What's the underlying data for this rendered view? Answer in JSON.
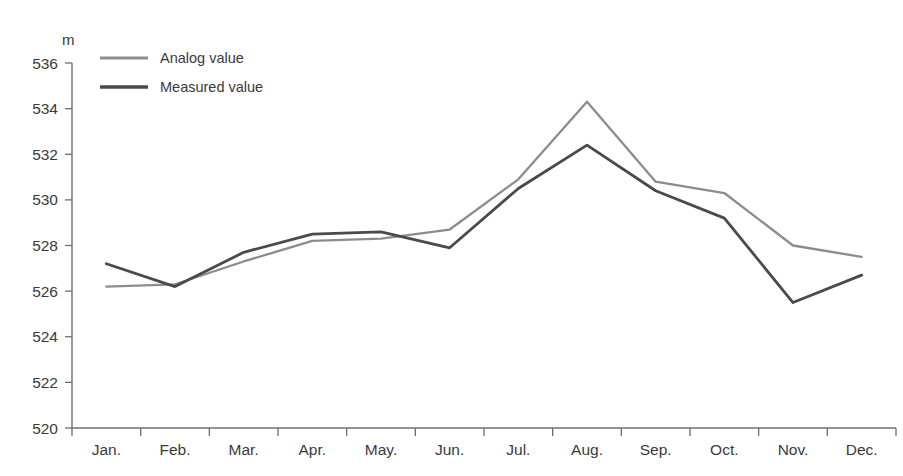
{
  "chart_data": {
    "type": "line",
    "title": "",
    "xlabel": "",
    "ylabel": "m",
    "unit_label": "m",
    "categories": [
      "Jan.",
      "Feb.",
      "Mar.",
      "Apr.",
      "May.",
      "Jun.",
      "Jul.",
      "Aug.",
      "Sep.",
      "Oct.",
      "Nov.",
      "Dec."
    ],
    "ylim": [
      520,
      536
    ],
    "ytick_step": 2,
    "ytick_labels": [
      "520",
      "522",
      "524",
      "526",
      "528",
      "530",
      "532",
      "534",
      "536"
    ],
    "grid": false,
    "legend_position": "top-left",
    "series": [
      {
        "name": "Analog value",
        "color": "#8c8c8c",
        "values": [
          526.2,
          526.3,
          527.3,
          528.2,
          528.3,
          528.7,
          530.9,
          534.3,
          530.8,
          530.3,
          528.0,
          527.5
        ]
      },
      {
        "name": "Measured value",
        "color": "#4a4a4a",
        "values": [
          527.2,
          526.2,
          527.7,
          528.5,
          528.6,
          527.9,
          530.5,
          532.4,
          530.4,
          529.2,
          525.5,
          526.7
        ]
      }
    ]
  },
  "legend": {
    "items": [
      {
        "label": "Analog value"
      },
      {
        "label": "Measured value"
      }
    ]
  },
  "axes": {
    "y_unit": "m"
  }
}
